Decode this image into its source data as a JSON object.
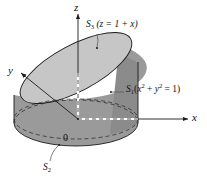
{
  "figure": {
    "name": "solid-cylinder-cut-by-plane",
    "background_color": "#ffffff",
    "axes": {
      "z": {
        "label": "z",
        "direction": "up"
      },
      "y": {
        "label": "y",
        "direction": "upper-left"
      },
      "x": {
        "label": "x",
        "direction": "right"
      },
      "origin": {
        "label": "0"
      }
    },
    "surfaces": [
      {
        "id": "S1",
        "name": "lateral-cylinder-surface",
        "symbol": "S",
        "subscript": "1",
        "equation_open": "(",
        "equation_var1": "x",
        "equation_sup1": "2",
        "equation_plus": " + ",
        "equation_var2": "y",
        "equation_sup2": "2",
        "equation_eq": " = 1)",
        "full_label": "S1 (x^2 + y^2 = 1)",
        "fill_color": "#919191"
      },
      {
        "id": "S2",
        "name": "bottom-disk-surface",
        "symbol": "S",
        "subscript": "2",
        "full_label": "S2",
        "fill_color": "#a8a8a8"
      },
      {
        "id": "S3",
        "name": "top-slanted-plane-surface",
        "symbol": "S",
        "subscript": "3",
        "equation": " (z = 1 + x)",
        "full_label": "S3 (z = 1 + x)",
        "fill_color": "#c8c8c8"
      }
    ],
    "colors": {
      "top_ellipse_fill": "#c8c8c8",
      "cylinder_side_fill": "#919191",
      "cylinder_front_fill": "#a0a0a0",
      "base_fill": "#b0b0b0",
      "stroke": "#1b1b1b",
      "dashed_stroke": "#2a2a2a",
      "leader_stroke": "#555555"
    }
  }
}
